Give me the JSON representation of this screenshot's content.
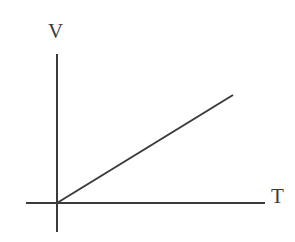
{
  "figure": {
    "name": "volume-temperature-linear-graph",
    "background_color": "#ffffff",
    "line_color": "#3b3b3b",
    "axis_color": "#3b3b3b",
    "width": 295,
    "height": 242
  },
  "labels": {
    "y_axis": "V",
    "x_axis": "T"
  },
  "chart_data": {
    "type": "line",
    "title": "",
    "xlabel": "T",
    "ylabel": "V",
    "x": [
      0,
      1
    ],
    "series": [
      {
        "name": "V vs T",
        "values": [
          0,
          1
        ]
      }
    ],
    "annotations": [],
    "legend": null,
    "grid": false,
    "ticks": {
      "x": [],
      "y": []
    },
    "xlim": [
      -0.18,
      1.2
    ],
    "ylim": [
      -0.27,
      1.38
    ],
    "origin_label": ""
  },
  "geometry": {
    "origin": {
      "x": 57,
      "y": 203
    },
    "y_axis": {
      "x": 57,
      "y_top": 54,
      "y_bottom": 232,
      "width": 2
    },
    "x_axis": {
      "y": 203,
      "x_left": 26,
      "x_right": 265,
      "width": 2
    },
    "data_line": {
      "x1": 57,
      "y1": 203,
      "x2": 233,
      "y2": 95,
      "width": 2
    }
  }
}
